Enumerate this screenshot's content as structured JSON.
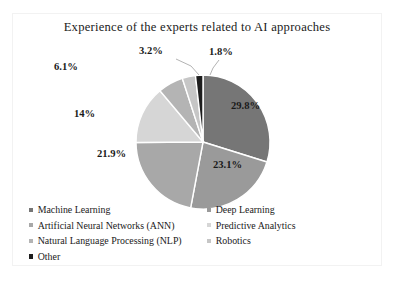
{
  "chart_data": {
    "type": "pie",
    "title": "Experience of the experts related to AI approaches",
    "xlabel": "",
    "ylabel": "",
    "legend_position": "bottom",
    "grid": false,
    "categories": [
      "Machine Learning",
      "Deep Learning",
      "Artificial Neural Networks (ANN)",
      "Predictive Analytics",
      "Natural Language Processing (NLP)",
      "Robotics",
      "Other"
    ],
    "values": [
      29.8,
      23.1,
      21.9,
      14,
      6.1,
      3.2,
      1.8
    ],
    "value_labels": [
      "29.8%",
      "23.1%",
      "21.9%",
      "14%",
      "6.1%",
      "3.2%",
      "1.8%"
    ],
    "colors": [
      "#767676",
      "#9a9a9a",
      "#a8a8a8",
      "#d6d6d6",
      "#b4b4b4",
      "#c6c6c6",
      "#1d1d1d"
    ],
    "slice_order": "clockwise from 12 o'clock",
    "units": "percent"
  },
  "legend": {
    "items": [
      {
        "label": "Machine Learning",
        "color": "#767676"
      },
      {
        "label": "Deep Learning",
        "color": "#9a9a9a"
      },
      {
        "label": "Artificial Neural Networks (ANN)",
        "color": "#a8a8a8"
      },
      {
        "label": "Predictive Analytics",
        "color": "#d6d6d6"
      },
      {
        "label": "Natural Language Processing (NLP)",
        "color": "#b4b4b4"
      },
      {
        "label": "Robotics",
        "color": "#c6c6c6"
      },
      {
        "label": "Other",
        "color": "#1d1d1d"
      }
    ]
  },
  "labels": {
    "machine_learning": "29.8%",
    "deep_learning": "23.1%",
    "ann": "21.9%",
    "predictive_analytics": "14%",
    "nlp": "6.1%",
    "robotics": "3.2%",
    "other": "1.8%"
  }
}
